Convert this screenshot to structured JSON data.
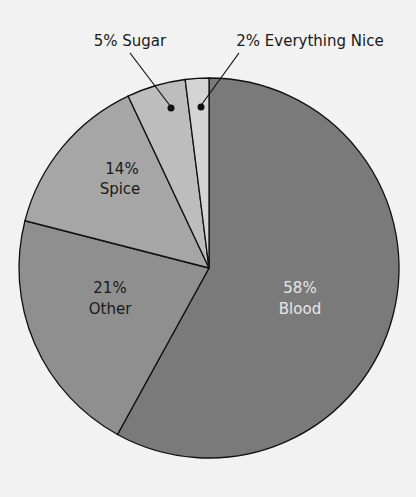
{
  "chart_data": {
    "type": "pie",
    "title": "",
    "slices": [
      {
        "label": "Blood",
        "value": 58,
        "color": "#7a7a7a",
        "text_color": "#e6e6e6"
      },
      {
        "label": "Other",
        "value": 21,
        "color": "#8f8f8f",
        "text_color": "#1a1a1a"
      },
      {
        "label": "Spice",
        "value": 14,
        "color": "#a6a6a6",
        "text_color": "#1a1a1a"
      },
      {
        "label": "Sugar",
        "value": 5,
        "color": "#bdbdbd",
        "text_color": "#1a1a1a"
      },
      {
        "label": "Everything Nice",
        "value": 2,
        "color": "#d4d4d4",
        "text_color": "#1a1a1a"
      }
    ],
    "labels": {
      "blood_pct": "58%",
      "blood_name": "Blood",
      "other_pct": "21%",
      "other_name": "Other",
      "spice_pct": "14%",
      "spice_name": "Spice",
      "sugar": "5% Sugar",
      "nice": "2% Everything Nice"
    }
  }
}
